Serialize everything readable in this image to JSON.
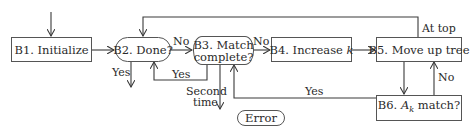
{
  "nodes": {
    "b1": {
      "label": "B1. Initialize"
    },
    "b2": {
      "label": "B2. Done?"
    },
    "b3": {
      "line1": "B3. Match",
      "line2": "complete?"
    },
    "b4": {
      "prefix": "B4. Increase ",
      "var": "k"
    },
    "b5": {
      "label": "B5. Move up tree"
    },
    "b6": {
      "prefix": "B6. ",
      "var": "A",
      "sub": "k",
      "suffix": " match?"
    },
    "error": {
      "label": "Error"
    }
  },
  "edges": {
    "b2_b3": "No",
    "b3_b4": "No",
    "b2_out": "Yes",
    "b3_b2": "Yes",
    "b3_error_line1": "Second",
    "b3_error_line2": "time",
    "b6_b3": "Yes",
    "b6_b5": "No",
    "b5_b2_top": "At top"
  },
  "colors": {
    "stroke": "#3a3a3a",
    "text": "#2a2a2a",
    "background": "#ffffff"
  }
}
